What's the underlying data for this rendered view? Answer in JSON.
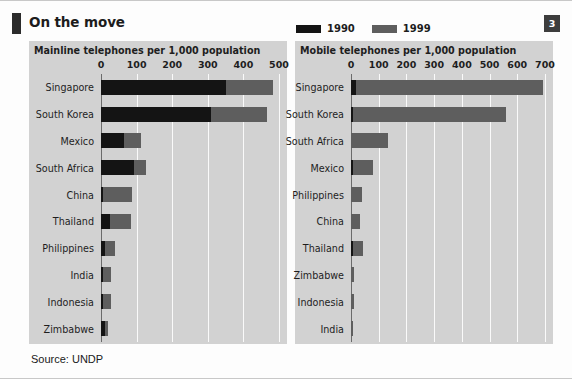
{
  "header": {
    "title": "On the move",
    "page_number": "3",
    "legend": [
      {
        "label": "1990",
        "color": "#141414"
      },
      {
        "label": "1999",
        "color": "#5e5e5e"
      }
    ]
  },
  "footer": {
    "source": "Source: UNDP"
  },
  "chart_data": [
    {
      "type": "bar",
      "orientation": "horizontal",
      "title": "Mainline telephones per 1,000 population",
      "xlabel": "",
      "ylabel": "",
      "xlim": [
        0,
        500
      ],
      "ticks": [
        0,
        100,
        200,
        300,
        400,
        500
      ],
      "tick_labels": [
        "0",
        "100",
        "200",
        "300",
        "400",
        "500"
      ],
      "grid": true,
      "legend_position": "top-right",
      "categories": [
        "Singapore",
        "South Korea",
        "Mexico",
        "South Africa",
        "China",
        "Thailand",
        "Philippines",
        "India",
        "Indonesia",
        "Zimbabwe"
      ],
      "series": [
        {
          "name": "1990",
          "color": "#141414",
          "values": [
            350,
            310,
            65,
            93,
            6,
            24,
            10,
            6,
            6,
            12
          ]
        },
        {
          "name": "1999",
          "color": "#5e5e5e",
          "values": [
            482,
            465,
            112,
            125,
            86,
            84,
            39,
            27,
            29,
            19
          ]
        }
      ]
    },
    {
      "type": "bar",
      "orientation": "horizontal",
      "title": "Mobile telephones per 1,000 population",
      "xlabel": "",
      "ylabel": "",
      "xlim": [
        0,
        700
      ],
      "ticks": [
        0,
        100,
        200,
        300,
        400,
        500,
        600,
        700
      ],
      "tick_labels": [
        "0",
        "100",
        "200",
        "300",
        "400",
        "500",
        "600",
        "700"
      ],
      "grid": true,
      "legend_position": "top-right",
      "categories": [
        "Singapore",
        "South Korea",
        "South Africa",
        "Mexico",
        "Philippines",
        "China",
        "Thailand",
        "Zimbabwe",
        "Indonesia",
        "India"
      ],
      "series": [
        {
          "name": "1990",
          "color": "#141414",
          "values": [
            17,
            2,
            0,
            1,
            0,
            0,
            1,
            0,
            0,
            0
          ]
        },
        {
          "name": "1999",
          "color": "#5e5e5e",
          "values": [
            692,
            560,
            132,
            79,
            38,
            34,
            43,
            12,
            11,
            2
          ]
        }
      ]
    }
  ]
}
